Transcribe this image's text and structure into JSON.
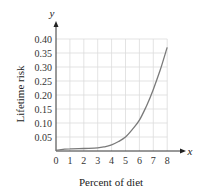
{
  "chart_data": {
    "type": "line",
    "title": "",
    "xlabel": "Percent of diet",
    "ylabel": "Lifetime risk",
    "x_axis_var": "x",
    "y_axis_var": "y",
    "xlim": [
      0,
      8
    ],
    "ylim": [
      0,
      0.4
    ],
    "grid": true,
    "legend": null,
    "x_ticks": [
      "0",
      "1",
      "2",
      "3",
      "4",
      "5",
      "6",
      "7",
      "8"
    ],
    "y_ticks": [
      "0.05",
      "0.10",
      "0.15",
      "0.20",
      "0.25",
      "0.30",
      "0.35",
      "0.40"
    ],
    "series": [
      {
        "name": "Lifetime risk",
        "color": "#7a7a7a",
        "x": [
          0,
          0.5,
          1,
          2,
          3,
          3.5,
          4,
          4.5,
          5,
          5.5,
          6,
          6.5,
          7,
          7.5,
          8
        ],
        "values": [
          0.003,
          0.006,
          0.008,
          0.009,
          0.011,
          0.015,
          0.022,
          0.034,
          0.05,
          0.077,
          0.11,
          0.16,
          0.22,
          0.29,
          0.37
        ]
      }
    ]
  }
}
